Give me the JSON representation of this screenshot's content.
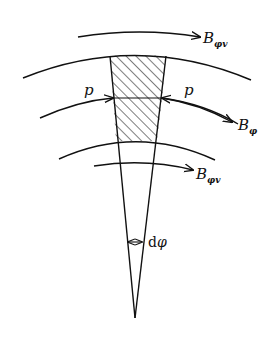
{
  "diagram": {
    "type": "sector-element-with-stresses",
    "labels": {
      "b_top": {
        "main": "B",
        "sub": "φv"
      },
      "b_mid": {
        "main": "B",
        "sub": "φ"
      },
      "b_bottom": {
        "main": "B",
        "sub": "φv"
      },
      "p_left": "p",
      "p_right": "p",
      "angle_d": "d",
      "angle_phi": "φ"
    },
    "colors": {
      "stroke": "#111111",
      "background": "#ffffff"
    }
  }
}
